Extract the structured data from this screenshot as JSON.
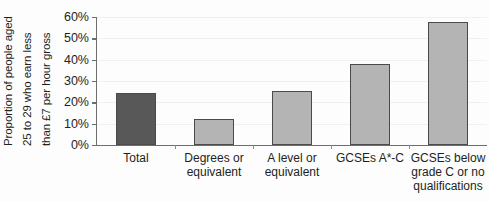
{
  "chart_data": {
    "type": "bar",
    "title": "",
    "subtitle": "",
    "xlabel": "",
    "ylabel": "Proportion of people aged 25 to 29 who earn less than £7 per hour gross",
    "ylabel_lines": [
      "Proportion of people aged",
      "25 to 29 who earn less",
      "than £7 per hour gross"
    ],
    "categories": [
      "Total",
      "Degrees or equivalent",
      "A level or equivalent",
      "GCSEs A*-C",
      "GCSEs below grade C or no qualifications"
    ],
    "category_label_lines": [
      [
        "Total"
      ],
      [
        "Degrees or",
        "equivalent"
      ],
      [
        "A level or",
        "equivalent"
      ],
      [
        "GCSEs A*-C"
      ],
      [
        "GCSEs below",
        "grade C or no",
        "qualifications"
      ]
    ],
    "values": [
      24.5,
      12.0,
      25.5,
      38.0,
      57.5
    ],
    "value_labels": [
      "24.5%",
      "12.0%",
      "25.5%",
      "38.0%",
      "57.5%"
    ],
    "ylim": [
      0,
      60
    ],
    "yticks": [
      0,
      10,
      20,
      30,
      40,
      50,
      60
    ],
    "ytick_labels": [
      "0%",
      "10%",
      "20%",
      "30%",
      "40%",
      "50%",
      "60%"
    ],
    "grid": true,
    "grid_axis": "y",
    "legend": "none",
    "bar_colors": [
      "#585858",
      "#b4b4b4",
      "#b4b4b4",
      "#b4b4b4",
      "#b4b4b4"
    ],
    "bar_edge_color": "#4a4a4a",
    "axis_color": "#6d6e71",
    "text_color": "#231f20",
    "background_color": "#fdfdfd"
  }
}
